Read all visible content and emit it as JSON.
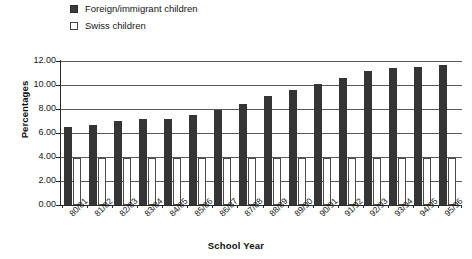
{
  "chart_data": {
    "type": "bar",
    "title": "",
    "xlabel": "School Year",
    "ylabel": "Percentages",
    "categories": [
      "80/81",
      "81/82",
      "82/83",
      "83/84",
      "84/85",
      "85/86",
      "86/87",
      "87/88",
      "88/89",
      "89/90",
      "90/91",
      "91/92",
      "92/93",
      "93/94",
      "94/95",
      "95/96"
    ],
    "series": [
      {
        "name": "Foreign/immigrant children",
        "color": "#353535",
        "values": [
          6.5,
          6.7,
          7.0,
          7.2,
          7.2,
          7.5,
          7.9,
          8.4,
          9.1,
          9.6,
          10.1,
          10.6,
          11.2,
          11.4,
          11.5,
          11.7
        ]
      },
      {
        "name": "Swiss children",
        "color": "#ffffff",
        "values": [
          3.9,
          3.9,
          3.9,
          3.9,
          3.9,
          3.9,
          3.9,
          3.9,
          3.9,
          3.9,
          3.9,
          3.9,
          3.9,
          3.9,
          3.9,
          3.9
        ]
      }
    ],
    "ylim": [
      0.0,
      12.0
    ],
    "ytick_values": [
      0.0,
      2.0,
      4.0,
      6.0,
      8.0,
      10.0,
      12.0
    ],
    "ytick_labels": [
      "0.00",
      "2.00",
      "4.00",
      "6.00",
      "8.00",
      "10.00",
      "12.00"
    ],
    "grid": "horizontal",
    "legend_position": "top-left"
  },
  "legend": {
    "items": [
      {
        "label": "Foreign/immigrant children",
        "marker": "filled-square"
      },
      {
        "label": "Swiss children",
        "marker": "hollow-square"
      }
    ]
  },
  "axes": {
    "y_title": "Percentages",
    "x_title": "School Year"
  }
}
